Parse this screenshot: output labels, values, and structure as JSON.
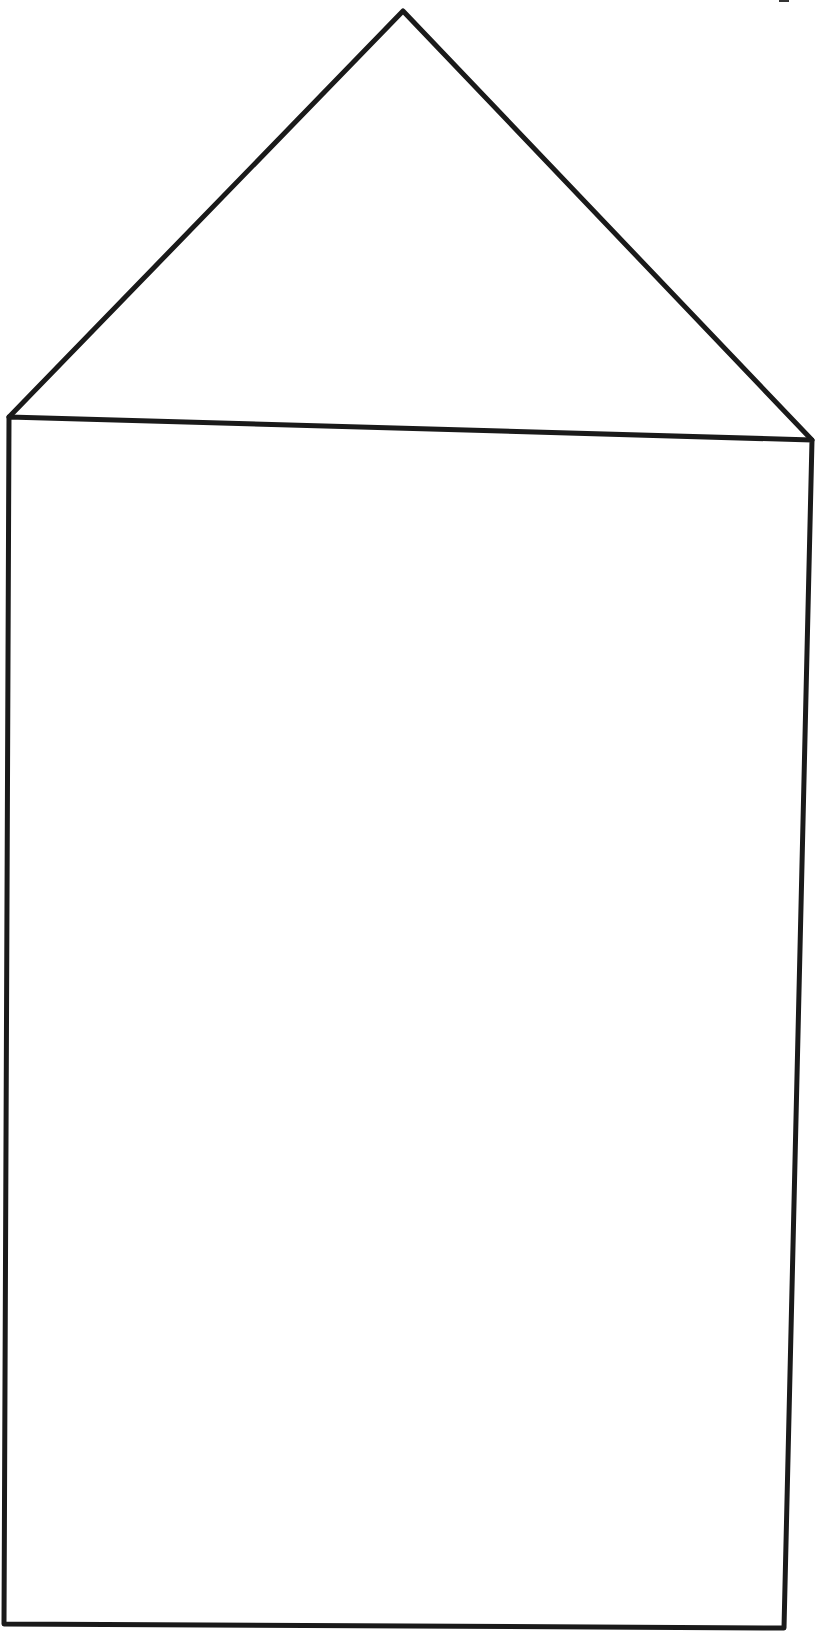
{
  "figure": {
    "stroke_color": "#1a1a1a",
    "background": "#ffffff",
    "roof": {
      "apex": [
        403,
        11
      ],
      "left": [
        9,
        417
      ],
      "right": [
        812,
        440
      ]
    },
    "body": {
      "top_left": [
        9,
        417
      ],
      "top_right": [
        812,
        440
      ],
      "bottom_right": [
        784,
        1628
      ],
      "bottom_left": [
        4,
        1624
      ]
    }
  }
}
